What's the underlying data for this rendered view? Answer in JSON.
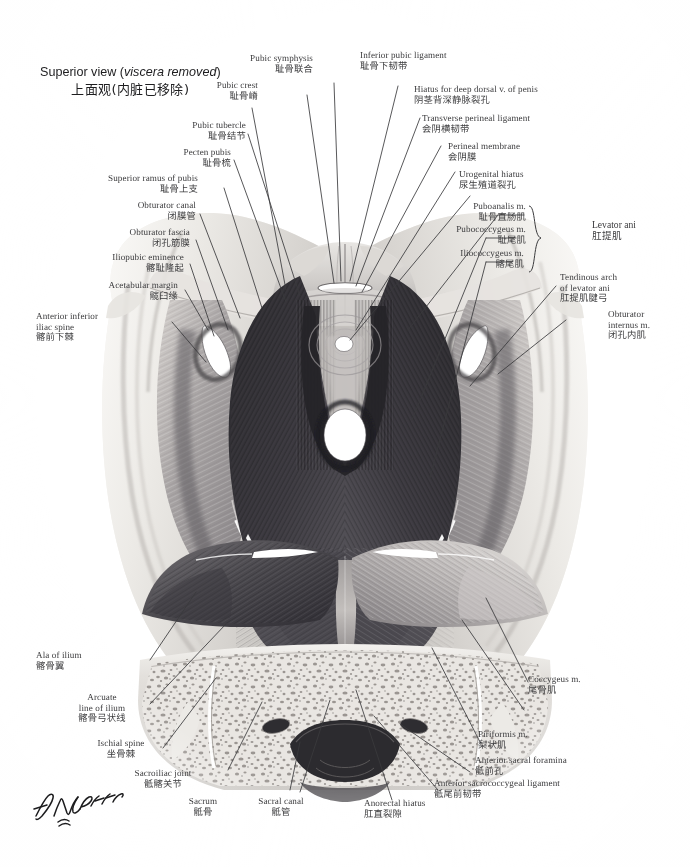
{
  "plate": {
    "view_caption_en_1": "Superior view (",
    "view_caption_en_italic": "viscera removed",
    "view_caption_en_2": ")",
    "view_caption_cn": "上面观(内脏已移除)",
    "signature": "F. Netter",
    "background": "#ffffff",
    "label_color": "#3b3b3d",
    "leader_color": "#3a3a3c"
  },
  "group_label": {
    "en": "Levator ani",
    "cn": "肛提肌"
  },
  "labels": [
    {
      "id": "pubic-symphysis",
      "en": "Pubic symphysis",
      "cn": "耻骨联合"
    },
    {
      "id": "inferior-pubic-ligament",
      "en": "Inferior pubic ligament",
      "cn": "耻骨下韧带"
    },
    {
      "id": "hiatus-deep-dorsal-vein",
      "en": "Hiatus for deep dorsal v. of penis",
      "cn": "阴茎背深静脉裂孔"
    },
    {
      "id": "transverse-perineal-ligament",
      "en": "Transverse perineal ligament",
      "cn": "会阴横韧带"
    },
    {
      "id": "perineal-membrane",
      "en": "Perineal membrane",
      "cn": "会阴膜"
    },
    {
      "id": "urogenital-hiatus",
      "en": "Urogenital hiatus",
      "cn": "尿生殖道裂孔"
    },
    {
      "id": "puboanalis",
      "en": "Puboanalis m.",
      "cn": "耻骨直肠肌"
    },
    {
      "id": "pubococcygeus",
      "en": "Pubococcygeus m.",
      "cn": "耻尾肌"
    },
    {
      "id": "iliococcygeus",
      "en": "Iliococcygeus m.",
      "cn": "髂尾肌"
    },
    {
      "id": "tendinous-arch",
      "en": "Tendinous arch\nof levator ani",
      "cn": "肛提肌腱弓"
    },
    {
      "id": "obturator-internus",
      "en": "Obturator\ninternus m.",
      "cn": "闭孔内肌"
    },
    {
      "id": "pubic-crest",
      "en": "Pubic crest",
      "cn": "耻骨嵴"
    },
    {
      "id": "pubic-tubercle",
      "en": "Pubic tubercle",
      "cn": "耻骨结节"
    },
    {
      "id": "pecten-pubis",
      "en": "Pecten pubis",
      "cn": "耻骨梳"
    },
    {
      "id": "superior-ramus-pubis",
      "en": "Superior ramus of pubis",
      "cn": "耻骨上支"
    },
    {
      "id": "obturator-canal",
      "en": "Obturator canal",
      "cn": "闭膜管"
    },
    {
      "id": "obturator-fascia",
      "en": "Obturator fascia",
      "cn": "闭孔筋膜"
    },
    {
      "id": "iliopubic-eminence",
      "en": "Iliopubic eminence",
      "cn": "髂耻隆起"
    },
    {
      "id": "acetabular-margin",
      "en": "Acetabular margin",
      "cn": "髋臼缘"
    },
    {
      "id": "anterior-inferior-iliac-spine",
      "en": "Anterior inferior\niliac spine",
      "cn": "髂前下棘"
    },
    {
      "id": "ala-of-ilium",
      "en": "Ala of ilium",
      "cn": "髂骨翼"
    },
    {
      "id": "arcuate-line-ilium",
      "en": "Arcuate\nline of ilium",
      "cn": "髂骨弓状线"
    },
    {
      "id": "ischial-spine",
      "en": "Ischial spine",
      "cn": "坐骨棘"
    },
    {
      "id": "sacroiliac-joint",
      "en": "Sacroiliac joint",
      "cn": "骶髂关节"
    },
    {
      "id": "sacrum",
      "en": "Sacrum",
      "cn": "骶骨"
    },
    {
      "id": "sacral-canal",
      "en": "Sacral canal",
      "cn": "骶管"
    },
    {
      "id": "anorectal-hiatus",
      "en": "Anorectal hiatus",
      "cn": "肛直裂隙"
    },
    {
      "id": "anterior-sacrococcygeal-ligament",
      "en": "Anterior sacrococcygeal ligament",
      "cn": "骶尾前韧带"
    },
    {
      "id": "anterior-sacral-foramina",
      "en": "Anterior sacral foramina",
      "cn": "骶前孔"
    },
    {
      "id": "piriformis",
      "en": "Piriformis m.",
      "cn": "梨状肌"
    },
    {
      "id": "coccygeus",
      "en": "Coccygeus m.",
      "cn": "尾骨肌"
    }
  ]
}
